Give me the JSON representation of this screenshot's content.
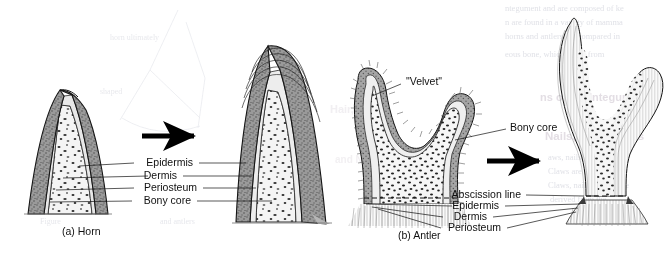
{
  "figure": {
    "background_color": "#ffffff",
    "width": 672,
    "height": 262
  },
  "panels": [
    {
      "id": "panel-a",
      "caption": "(a) Horn",
      "caption_x": 62,
      "caption_y": 232,
      "arrow": {
        "x1": 142,
        "y1": 136,
        "x2": 200,
        "y2": 136
      },
      "labels": [
        {
          "key": "epidermis",
          "text": "Epidermis",
          "x": 193,
          "y": 163
        },
        {
          "key": "dermis",
          "text": "Dermis",
          "x": 177,
          "y": 176
        },
        {
          "key": "periosteum",
          "text": "Periosteum",
          "x": 197,
          "y": 188
        },
        {
          "key": "bony_core",
          "text": "Bony core",
          "x": 191,
          "y": 201
        }
      ]
    },
    {
      "id": "panel-b",
      "caption": "(b) Antler",
      "caption_x": 398,
      "caption_y": 236,
      "arrow": {
        "x1": 487,
        "y1": 161,
        "x2": 545,
        "y2": 161
      },
      "labels": [
        {
          "key": "velvet",
          "text": "\"Velvet\"",
          "x": 240,
          "y": 87
        },
        {
          "key": "bony_core",
          "text": "Bony core",
          "x": 516,
          "y": 128
        },
        {
          "key": "abscission_line",
          "text": "Abscission line",
          "x": 521,
          "y": 195
        },
        {
          "key": "epidermis",
          "text": "Epidermis",
          "x": 499,
          "y": 206
        },
        {
          "key": "dermis",
          "text": "Dermis",
          "x": 487,
          "y": 217
        },
        {
          "key": "periosteum",
          "text": "Periosteum",
          "x": 501,
          "y": 228
        }
      ]
    }
  ],
  "colors": {
    "outline": "#111111",
    "epidermis_fill": "#9c9c9c",
    "dermis_fill": "#d8d8d8",
    "bone_fill": "#f2f2f2",
    "arrow": "#000000",
    "label_text": "#101010",
    "bleed_text": "#dfe0e6",
    "bleed_heading": "#e2dde3"
  },
  "bleed_through": {
    "note": "faint mirrored show-through text from the reverse side of the printed page",
    "lines": [
      {
        "text": "ntegument and are composed of ke",
        "x": 505,
        "y": 9,
        "size": 8.5,
        "style": "serif"
      },
      {
        "text": "n are found in a variety of mamma",
        "x": 505,
        "y": 23,
        "size": 8.5,
        "style": "serif"
      },
      {
        "text": "horns and antlers are compared in",
        "x": 505,
        "y": 37,
        "size": 8.5,
        "style": "serif"
      },
      {
        "text": "eous bone, which arises from",
        "x": 505,
        "y": 55,
        "size": 8.5,
        "style": "serif"
      },
      {
        "text": "ns of the Integument",
        "x": 540,
        "y": 98,
        "size": 11,
        "style": "bold"
      },
      {
        "text": "Nails, and Hooves",
        "x": 545,
        "y": 137,
        "size": 11.5,
        "style": "bold"
      },
      {
        "text": "aws, nails, and hooves",
        "x": 548,
        "y": 158,
        "size": 8.5,
        "style": "serif"
      },
      {
        "text": "Claws are found on the",
        "x": 548,
        "y": 172,
        "size": 8.5,
        "style": "serif"
      },
      {
        "text": "Claws, nails, and hoove",
        "x": 548,
        "y": 186,
        "size": 8.5,
        "style": "serif"
      },
      {
        "text": "derived from the",
        "x": 550,
        "y": 200,
        "size": 8.5,
        "style": "serif"
      },
      {
        "text": "Hair, Claws,",
        "x": 330,
        "y": 110,
        "size": 11,
        "style": "bold"
      },
      {
        "text": "and Nails",
        "x": 335,
        "y": 160,
        "size": 10,
        "style": "bold"
      },
      {
        "text": "Figure",
        "x": 40,
        "y": 222,
        "size": 8,
        "style": "serif"
      },
      {
        "text": "and antlers",
        "x": 160,
        "y": 222,
        "size": 8,
        "style": "serif"
      },
      {
        "text": "horn ultimately",
        "x": 110,
        "y": 38,
        "size": 8,
        "style": "serif"
      },
      {
        "text": "shaped",
        "x": 100,
        "y": 92,
        "size": 8,
        "style": "serif"
      }
    ]
  },
  "icon_names": {
    "growth_arrow": "right-arrow-icon",
    "leader_line": "leader-line"
  }
}
